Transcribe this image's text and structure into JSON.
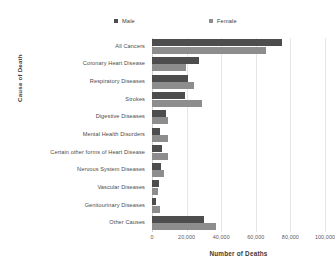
{
  "chart_data": {
    "type": "bar",
    "orientation": "horizontal",
    "title": "",
    "xlabel": "Number of Deaths",
    "ylabel": "Cause of Death",
    "xlim": [
      0,
      100000
    ],
    "xticks": [
      0,
      20000,
      40000,
      60000,
      80000,
      100000
    ],
    "xtick_labels": [
      "0",
      "20,000",
      "40,000",
      "60,000",
      "80,000",
      "100,000"
    ],
    "grid": true,
    "grid_axis": "x",
    "legend_position": "top",
    "categories": [
      "All Cancers",
      "Coronary Heart Disease",
      "Respiratory Diseases",
      "Strokes",
      "Digestive Diseases",
      "Mental Health Disorders",
      "Certain other forms of Heart Disease",
      "Nervous System Diseases",
      "Vascular Diseases",
      "Genitourinary Diseases",
      "Other Causes"
    ],
    "series": [
      {
        "name": "Male",
        "color": "#4d4d4d",
        "values": [
          75000,
          27000,
          21000,
          19000,
          8000,
          4500,
          5500,
          5000,
          4000,
          2500,
          30000
        ]
      },
      {
        "name": "Female",
        "color": "#8d8d8d",
        "values": [
          66000,
          19500,
          24000,
          29000,
          9000,
          9500,
          9000,
          7000,
          3500,
          4500,
          37000
        ]
      }
    ]
  },
  "legend": {
    "items": [
      {
        "label": "Male",
        "color": "#4d4d4d"
      },
      {
        "label": "Female",
        "color": "#8d8d8d"
      }
    ]
  }
}
